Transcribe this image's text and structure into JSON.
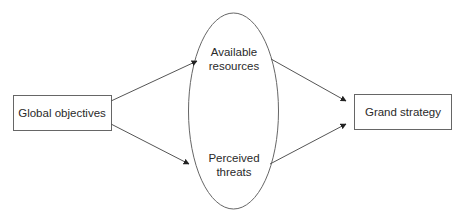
{
  "diagram": {
    "nodes": {
      "left": {
        "label": "Global objectives"
      },
      "ellipse_top": {
        "line1": "Available",
        "line2": "resources"
      },
      "ellipse_bottom": {
        "line1": "Perceived",
        "line2": "threats"
      },
      "right": {
        "label": "Grand strategy"
      }
    },
    "edges": [
      {
        "from": "Global objectives",
        "to": "Available resources"
      },
      {
        "from": "Global objectives",
        "to": "Perceived threats"
      },
      {
        "from": "Available resources",
        "to": "Grand strategy"
      },
      {
        "from": "Perceived threats",
        "to": "Grand strategy"
      }
    ],
    "colors": {
      "stroke": "#555555",
      "text": "#2a2a2a"
    }
  }
}
